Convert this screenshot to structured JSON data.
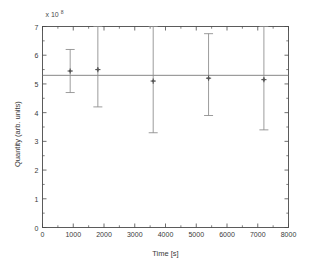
{
  "chart_data": {
    "type": "scatter",
    "title": "",
    "xlabel": "Time [s]",
    "ylabel": "Quantity (arb. units)",
    "y_exponent_label": "x 10",
    "y_exponent_power": "8",
    "xlim": [
      0,
      8000
    ],
    "ylim": [
      0,
      7
    ],
    "xticks": [
      0,
      1000,
      2000,
      3000,
      4000,
      5000,
      6000,
      7000,
      8000
    ],
    "xtick_labels": [
      "0",
      "1000",
      "2000",
      "3000",
      "4000",
      "5000",
      "6000",
      "7000",
      "8000"
    ],
    "yticks": [
      0,
      1,
      2,
      3,
      4,
      5,
      6,
      7
    ],
    "ytick_labels": [
      "0",
      "1",
      "2",
      "3",
      "4",
      "5",
      "6",
      "7"
    ],
    "grid": false,
    "box": true,
    "legend": "none",
    "marker": "dot",
    "marker_color": "#555555",
    "errorbar_color": "#8a8a8a",
    "fit_line_color": "#777777",
    "axis_color": "#4a4a4a",
    "series": [
      {
        "name": "Measurement",
        "x": [
          900,
          1800,
          3600,
          5400,
          7200
        ],
        "y": [
          5.45,
          5.5,
          5.1,
          5.2,
          5.15
        ],
        "yerr_low": [
          0.75,
          1.3,
          1.8,
          1.3,
          1.75
        ],
        "yerr_high": [
          0.75,
          1.5,
          1.9,
          1.55,
          1.85
        ]
      }
    ],
    "fit_line": {
      "name": "Constant fit",
      "y_value": 5.3,
      "x_start": 0,
      "x_end": 8000
    }
  }
}
